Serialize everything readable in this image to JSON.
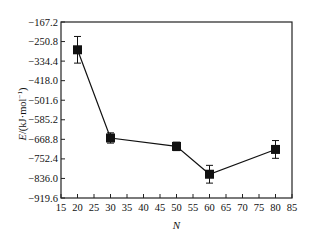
{
  "chart_data": {
    "type": "line",
    "title": "",
    "xlabel": "N",
    "ylabel": "E/(kJ·mol⁻¹)",
    "ylabel_parts": {
      "italic": "E",
      "rest": "/(kJ·mol",
      "sup": "−1",
      "close": ")"
    },
    "xlim": [
      15,
      85
    ],
    "ylim": [
      -919.6,
      -167.2
    ],
    "x_ticks": [
      15,
      20,
      25,
      30,
      35,
      40,
      45,
      50,
      55,
      60,
      65,
      70,
      75,
      80,
      85
    ],
    "y_ticks": [
      "-167.2",
      "-250.8",
      "-334.4",
      "-418.0",
      "-501.6",
      "-585.2",
      "-668.8",
      "-752.4",
      "-836.0",
      "-919.6"
    ],
    "grid": false,
    "legend": null,
    "series": [
      {
        "name": "E",
        "marker": "square",
        "color": "#111111",
        "x": [
          20,
          30,
          50,
          60,
          80
        ],
        "y": [
          -286,
          -663,
          -699,
          -818,
          -712
        ],
        "error": [
          57,
          22,
          18,
          38,
          38
        ]
      }
    ]
  }
}
